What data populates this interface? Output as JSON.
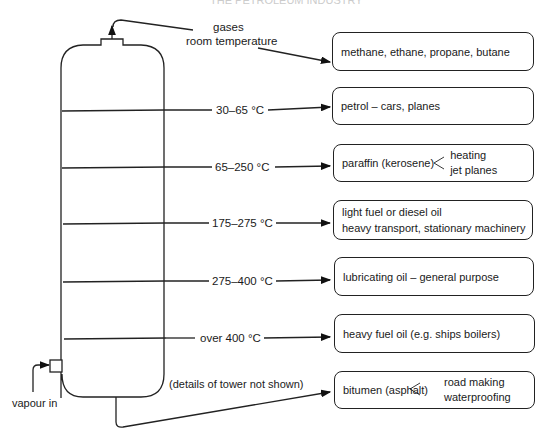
{
  "header": {
    "text": "THE PETROLEUM INDUSTRY"
  },
  "tower": {
    "note": "(details of tower not shown)",
    "input_label": "vapour in"
  },
  "top_output": {
    "label_line1": "gases",
    "label_line2": "room temperature"
  },
  "fractions": [
    {
      "temperature": "30–65 °C"
    },
    {
      "temperature": "65–250 °C"
    },
    {
      "temperature": "175–275 °C"
    },
    {
      "temperature": "275–400 °C"
    },
    {
      "temperature": "over 400 °C"
    }
  ],
  "products": [
    {
      "name": "methane, ethane, propane, butane"
    },
    {
      "name": "petrol – cars, planes"
    },
    {
      "name": "paraffin (kerosene)",
      "uses": [
        "heating",
        "jet planes"
      ]
    },
    {
      "line1": "light fuel or diesel oil",
      "line2": "heavy transport, stationary machinery"
    },
    {
      "name": "lubricating oil – general purpose"
    },
    {
      "name": "heavy fuel oil (e.g. ships boilers)"
    },
    {
      "name": "bitumen (asphalt)",
      "uses": [
        "road making",
        "waterproofing"
      ]
    }
  ]
}
